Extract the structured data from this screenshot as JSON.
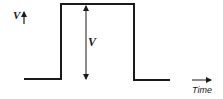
{
  "diagram": {
    "type": "rectangular-pulse",
    "y_axis_label": "V",
    "amplitude_label": "V",
    "x_axis_label": "Time",
    "line_color": "#1a1a1a",
    "background": "#ffffff"
  }
}
